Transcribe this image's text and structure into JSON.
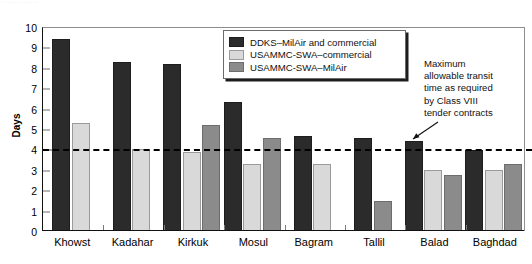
{
  "header_remnant": "············",
  "annotation": {
    "name": "threshold-annotation",
    "lines": [
      "Maximum",
      "allowable transit",
      "time as required",
      "by Class VIII",
      "tender contracts"
    ],
    "text": "Maximum allowable transit time as required by Class VIII tender contracts"
  },
  "legend": {
    "position": "inside-top-center",
    "items": [
      {
        "label": "DDKS–MilAir and commercial",
        "color": "#2b2b2b"
      },
      {
        "label": "USAMMC-SWA–commercial",
        "color": "#d9d9d9"
      },
      {
        "label": "USAMMC-SWA–MilAir",
        "color": "#8b8b8b"
      }
    ]
  },
  "chart_data": {
    "type": "bar",
    "title": "",
    "xlabel": "",
    "ylabel": "Days",
    "ylim": [
      0,
      10
    ],
    "yticks": [
      0,
      1,
      2,
      3,
      4,
      5,
      6,
      7,
      8,
      9,
      10
    ],
    "ytick_labels": [
      "0",
      "1",
      "2",
      "3",
      "4",
      "5",
      "6",
      "7",
      "8",
      "9",
      "10"
    ],
    "grid": false,
    "categories": [
      "Khowst",
      "Kadahar",
      "Kirkuk",
      "Mosul",
      "Bagram",
      "Tallil",
      "Balad",
      "Baghdad"
    ],
    "series": [
      {
        "name": "DDKS–MilAir and commercial",
        "color": "#2b2b2b",
        "values": [
          9.4,
          8.3,
          8.2,
          6.3,
          4.65,
          4.55,
          4.4,
          3.95
        ]
      },
      {
        "name": "USAMMC-SWA–commercial",
        "color": "#d9d9d9",
        "values": [
          5.3,
          4.0,
          3.85,
          3.3,
          3.3,
          null,
          3.0,
          3.0
        ]
      },
      {
        "name": "USAMMC-SWA–MilAir",
        "color": "#8b8b8b",
        "values": [
          null,
          null,
          5.2,
          4.55,
          null,
          1.45,
          2.75,
          3.3
        ]
      }
    ],
    "threshold_line": {
      "value": 4,
      "style": "dashed",
      "color": "#000000",
      "label": "Maximum allowable transit time as required by Class VIII tender contracts"
    }
  }
}
